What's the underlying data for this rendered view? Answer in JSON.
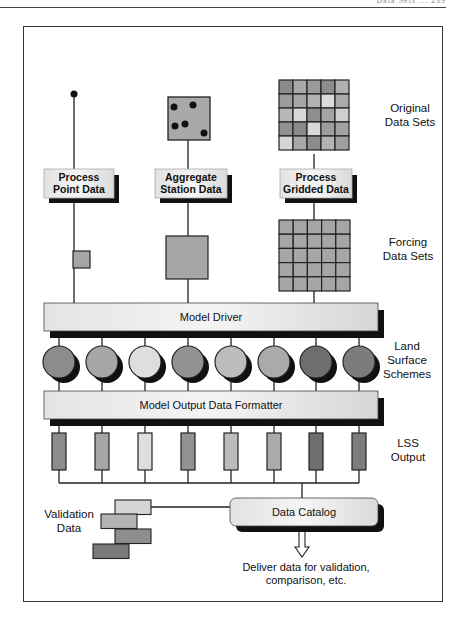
{
  "header": {
    "running_text": "Data  Sets  ...  239"
  },
  "stages": {
    "original": {
      "label_line1": "Original",
      "label_line2": "Data Sets"
    },
    "forcing": {
      "label_line1": "Forcing",
      "label_line2": "Data Sets"
    },
    "lss": {
      "label_line1": "Land",
      "label_line2": "Surface",
      "label_line3": "Schemes"
    },
    "output": {
      "label_line1": "LSS",
      "label_line2": "Output"
    }
  },
  "processes": [
    {
      "line1": "Process",
      "line2": "Point Data"
    },
    {
      "line1": "Aggregate",
      "line2": "Station Data"
    },
    {
      "line1": "Process",
      "line2": "Gridded Data"
    }
  ],
  "bars": {
    "model_driver": "Model Driver",
    "formatter": "Model Output Data Formatter"
  },
  "validation": {
    "line1": "Validation",
    "line2": "Data"
  },
  "catalog": {
    "label": "Data Catalog"
  },
  "deliver": {
    "line1": "Deliver data for validation,",
    "line2": "comparison, etc."
  },
  "colors": {
    "original_grid": [
      [
        "#8a8a8a",
        "#a8a8a8",
        "#9a9a9a",
        "#8c8c8c",
        "#b0b0b0"
      ],
      [
        "#9c9c9c",
        "#a6a6a6",
        "#b2b2b2",
        "#dcdcdc",
        "#aaaaaa"
      ],
      [
        "#b6b6b6",
        "#d8d8d8",
        "#8e8e8e",
        "#a4a4a4",
        "#cfcfcf"
      ],
      [
        "#909090",
        "#8a8a8a",
        "#dadada",
        "#9e9e9e",
        "#a2a2a2"
      ],
      [
        "#d6d6d6",
        "#a8a8a8",
        "#8c8c8c",
        "#b4b4b4",
        "#a0a0a0"
      ]
    ],
    "forcing_cell": "#a6a6a6",
    "schemes": [
      "#8c8c8c",
      "#a6a6a6",
      "#dedede",
      "#929292",
      "#bcbcbc",
      "#aaaaaa",
      "#6e6e6e",
      "#7c7c7c"
    ],
    "validation_blocks": [
      "#d6d6d6",
      "#b4b4b4",
      "#8e8e8e",
      "#7a7a7a"
    ]
  }
}
